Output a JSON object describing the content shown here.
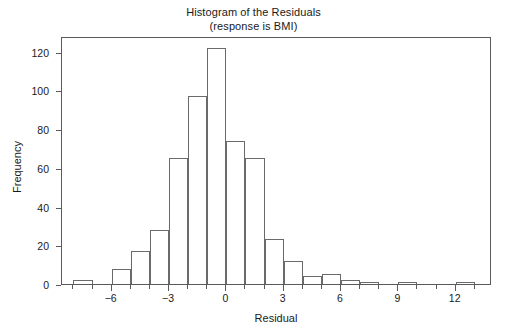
{
  "chart_data": {
    "type": "bar",
    "title": "Histogram of the Residuals",
    "subtitle": "(response is BMI)",
    "xlabel": "Residual",
    "ylabel": "Frequency",
    "xlim": [
      -8.6,
      13.9
    ],
    "ylim": [
      0,
      128
    ],
    "grid": false,
    "legend": null,
    "bin_width": 1,
    "xticks": [
      -6,
      -3,
      0,
      3,
      6,
      9,
      12
    ],
    "xtick_labels": [
      "−6",
      "−3",
      "0",
      "3",
      "6",
      "9",
      "12"
    ],
    "xtick_minor": [
      -8,
      -7,
      -5,
      -4,
      -2,
      -1,
      1,
      2,
      4,
      5,
      7,
      8,
      10,
      11,
      13
    ],
    "yticks": [
      0,
      20,
      40,
      60,
      80,
      100,
      120
    ],
    "ytick_labels": [
      "0",
      "20",
      "40",
      "60",
      "80",
      "100",
      "120"
    ],
    "bins": [
      {
        "left": -8,
        "right": -7,
        "center": -7.5,
        "value": 2
      },
      {
        "left": -6,
        "right": -5,
        "center": -5.5,
        "value": 8
      },
      {
        "left": -5,
        "right": -4,
        "center": -4.5,
        "value": 17
      },
      {
        "left": -4,
        "right": -3,
        "center": -3.5,
        "value": 28
      },
      {
        "left": -3,
        "right": -2,
        "center": -2.5,
        "value": 65
      },
      {
        "left": -2,
        "right": -1,
        "center": -1.5,
        "value": 97
      },
      {
        "left": -1,
        "right": 0,
        "center": -0.5,
        "value": 122
      },
      {
        "left": 0,
        "right": 1,
        "center": 0.5,
        "value": 74
      },
      {
        "left": 1,
        "right": 2,
        "center": 1.5,
        "value": 65
      },
      {
        "left": 2,
        "right": 3,
        "center": 2.5,
        "value": 23
      },
      {
        "left": 3,
        "right": 4,
        "center": 3.5,
        "value": 12
      },
      {
        "left": 4,
        "right": 5,
        "center": 4.5,
        "value": 4
      },
      {
        "left": 5,
        "right": 6,
        "center": 5.5,
        "value": 5
      },
      {
        "left": 6,
        "right": 7,
        "center": 6.5,
        "value": 2
      },
      {
        "left": 7,
        "right": 8,
        "center": 7.5,
        "value": 1
      },
      {
        "left": 9,
        "right": 10,
        "center": 9.5,
        "value": 1
      },
      {
        "left": 12,
        "right": 13,
        "center": 12.5,
        "value": 1
      }
    ],
    "colors": {
      "background": "#ffffff",
      "frame": "#5a5a5a",
      "bar_edge": "#6a6a6a",
      "bar_fill": "transparent",
      "text": "#1a1a1a"
    }
  }
}
